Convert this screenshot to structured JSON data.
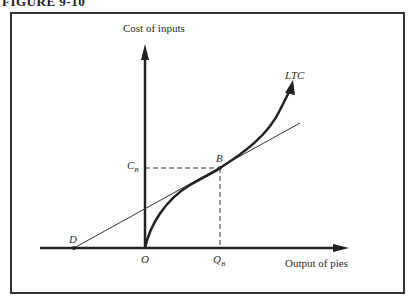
{
  "figure": {
    "title": "FIGURE 9-10"
  },
  "axes": {
    "y_label": "Cost of inputs",
    "x_label": "Output of pies"
  },
  "labels": {
    "curve": "LTC",
    "point_b": "B",
    "point_d": "D",
    "origin": "O",
    "c_b_main": "C",
    "c_b_sub": "B",
    "q_b_main": "Q",
    "q_b_sub": "B"
  },
  "colors": {
    "ink": "#2a2a2a",
    "frame": "#333333",
    "background": "#ffffff"
  }
}
